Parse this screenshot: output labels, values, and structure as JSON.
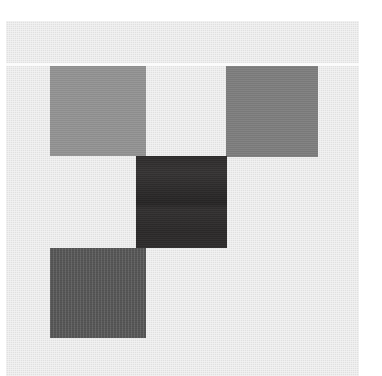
{
  "canvas": {
    "width": 382,
    "height": 376,
    "outer_background_color": "#ffffff",
    "panel_background_color": "#e3e3e3",
    "seam_line_color": "#fbfbfb",
    "seam_line_label": "horizontal-white-seam"
  },
  "figure": {
    "title": "",
    "tile_count": 4
  },
  "tiles": [
    {
      "name": "top-left-tile",
      "label": "",
      "color": "#929292",
      "tone": "medium gray",
      "x": 50,
      "y": 66,
      "width": 96,
      "height": 90,
      "texture": "flat"
    },
    {
      "name": "top-right-tile",
      "label": "",
      "color": "#7d7d7d",
      "tone": "dark medium gray",
      "x": 226,
      "y": 66,
      "width": 92,
      "height": 91,
      "texture": "flat"
    },
    {
      "name": "center-tile",
      "label": "",
      "color": "#2e2c2c",
      "tone": "near black",
      "x": 136,
      "y": 156,
      "width": 91,
      "height": 92,
      "texture": "streak"
    },
    {
      "name": "bottom-left-tile",
      "label": "",
      "color": "#5a5a5a",
      "tone": "dark gray",
      "x": 50,
      "y": 248,
      "width": 96,
      "height": 90,
      "texture": "vertical-stripe"
    }
  ]
}
